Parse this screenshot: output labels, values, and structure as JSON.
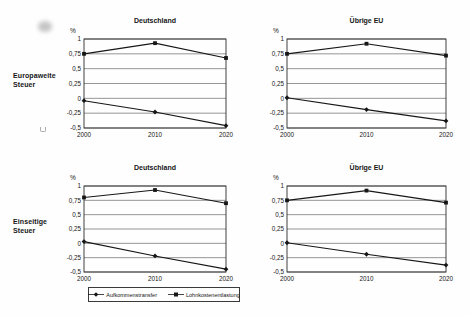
{
  "figure": {
    "row_labels": [
      "Europaweite\nSteuer",
      "Einseitige\nSteuer"
    ]
  },
  "legend": {
    "items": [
      {
        "label": "Aufkommenstransfer",
        "marker": "diamond"
      },
      {
        "label": "Lohnkostenentlastung",
        "marker": "square"
      }
    ]
  },
  "colors": {
    "ink": "#161616",
    "grid": "#4f4f4f",
    "frame": "#2e2e2e",
    "background": "#fefefe"
  },
  "chart_data": [
    {
      "type": "line",
      "title": "Deutschland",
      "group": "Europaweite Steuer",
      "ylabel": "%",
      "categories": [
        "2000",
        "2010",
        "2020"
      ],
      "ylim": [
        -0.5,
        1
      ],
      "yticks": [
        "1",
        "0,75",
        "0,5",
        "0,25",
        "0",
        "-0,25",
        "-0,5"
      ],
      "ytick_values": [
        1,
        0.75,
        0.5,
        0.25,
        0,
        -0.25,
        -0.5
      ],
      "grid": true,
      "series": [
        {
          "name": "Aufkommenstransfer",
          "marker": "diamond",
          "values": [
            -0.04,
            -0.23,
            -0.46
          ]
        },
        {
          "name": "Lohnkostenentlastung",
          "marker": "square",
          "values": [
            0.75,
            0.93,
            0.68
          ]
        }
      ]
    },
    {
      "type": "line",
      "title": "Übrige EU",
      "group": "Europaweite Steuer",
      "ylabel": "%",
      "categories": [
        "2000",
        "2010",
        "2020"
      ],
      "ylim": [
        -0.5,
        1
      ],
      "yticks": [
        "1",
        "0,75",
        "0,5",
        "0,25",
        "0",
        "-0,25",
        "-0,5"
      ],
      "ytick_values": [
        1,
        0.75,
        0.5,
        0.25,
        0,
        -0.25,
        -0.5
      ],
      "grid": true,
      "series": [
        {
          "name": "Aufkommenstransfer",
          "marker": "diamond",
          "values": [
            0.01,
            -0.19,
            -0.38
          ]
        },
        {
          "name": "Lohnkostenentlastung",
          "marker": "square",
          "values": [
            0.75,
            0.92,
            0.72
          ]
        }
      ]
    },
    {
      "type": "line",
      "title": "Deutschland",
      "group": "Einseitige Steuer",
      "ylabel": "%",
      "categories": [
        "2000",
        "2010",
        "2020"
      ],
      "ylim": [
        -0.5,
        1
      ],
      "yticks": [
        "1",
        "0,75",
        "0,5",
        "0,25",
        "0",
        "-0,25",
        "-0,5"
      ],
      "ytick_values": [
        1,
        0.75,
        0.5,
        0.25,
        0,
        -0.25,
        -0.5
      ],
      "grid": true,
      "series": [
        {
          "name": "Aufkommenstransfer",
          "marker": "diamond",
          "values": [
            0.03,
            -0.22,
            -0.45
          ]
        },
        {
          "name": "Lohnkostenentlastung",
          "marker": "square",
          "values": [
            0.8,
            0.93,
            0.7
          ]
        }
      ]
    },
    {
      "type": "line",
      "title": "Übrige EU",
      "group": "Einseitige Steuer",
      "ylabel": "%",
      "categories": [
        "2000",
        "2010",
        "2020"
      ],
      "ylim": [
        -0.5,
        1
      ],
      "yticks": [
        "1",
        "0,75",
        "0,5",
        "0,25",
        "0",
        "-0,25",
        "-0,5"
      ],
      "ytick_values": [
        1,
        0.75,
        0.5,
        0.25,
        0,
        -0.25,
        -0.5
      ],
      "grid": true,
      "series": [
        {
          "name": "Aufkommenstransfer",
          "marker": "diamond",
          "values": [
            0.01,
            -0.19,
            -0.38
          ]
        },
        {
          "name": "Lohnkostenentlastung",
          "marker": "square",
          "values": [
            0.75,
            0.92,
            0.71
          ]
        }
      ]
    }
  ]
}
